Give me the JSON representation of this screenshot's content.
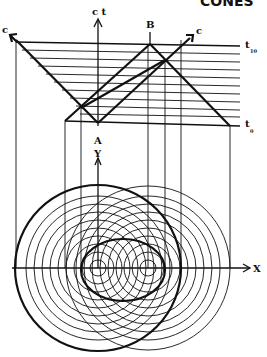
{
  "title": "CONES",
  "labels": {
    "ct_axis": "c t",
    "event_a": "A",
    "event_b": "B",
    "c_left": "c",
    "c_right": "c",
    "t_top": "t",
    "t_top_sub": "10",
    "t_bottom": "t",
    "t_bottom_sub": "0",
    "y_axis": "Y",
    "x_axis": "X"
  },
  "diagram": {
    "time_slices": 11,
    "circle_count_per_event": 10,
    "line_color": "#111111",
    "background": "#ffffff"
  }
}
